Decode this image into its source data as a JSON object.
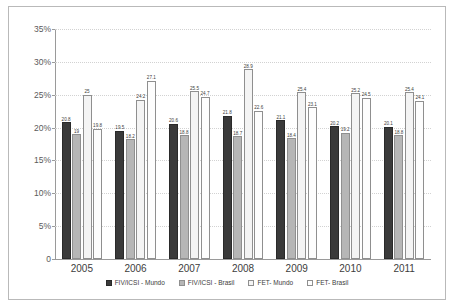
{
  "chart_data": {
    "type": "bar",
    "title": "",
    "xlabel": "",
    "ylabel": "",
    "ylim": [
      0,
      35
    ],
    "grid": true,
    "legend_position": "bottom",
    "categories": [
      "2005",
      "2006",
      "2007",
      "2008",
      "2009",
      "2010",
      "2011"
    ],
    "ytick_labels": [
      "0",
      "5%",
      "10%",
      "15%",
      "20%",
      "25%",
      "30%",
      "35%"
    ],
    "ytick_values": [
      0,
      5,
      10,
      15,
      20,
      25,
      30,
      35
    ],
    "series": [
      {
        "name": "FIV/ICSI - Mundo",
        "color": "#3a3a3a",
        "values": [
          20.8,
          19.5,
          20.6,
          21.8,
          21.1,
          20.2,
          20.1
        ],
        "labels": [
          "20.8",
          "19.5",
          "20.6",
          "21.8",
          "21.1",
          "20.2",
          "20.1"
        ]
      },
      {
        "name": "FIV/ICSI - Brasil",
        "color": "#b6b6b6",
        "values": [
          19.0,
          18.2,
          18.8,
          18.7,
          18.4,
          19.2,
          18.8
        ],
        "labels": [
          "19",
          "18.2",
          "18.8",
          "18.7",
          "18.4",
          "19.2",
          "18.8"
        ]
      },
      {
        "name": "FET- Mundo",
        "color": "#f4f4f4",
        "values": [
          25.0,
          24.2,
          25.5,
          28.9,
          25.4,
          25.2,
          25.4
        ],
        "labels": [
          "25",
          "24.2",
          "25.5",
          "28.9",
          "25.4",
          "25.2",
          "25.4"
        ]
      },
      {
        "name": "FET- Brasil",
        "color": "#fdfdfd",
        "values": [
          19.8,
          27.1,
          24.7,
          22.6,
          23.1,
          24.5,
          24.1
        ],
        "labels": [
          "19.8",
          "27.1",
          "24.7",
          "22.6",
          "23.1",
          "24.5",
          "24.1"
        ]
      }
    ]
  }
}
